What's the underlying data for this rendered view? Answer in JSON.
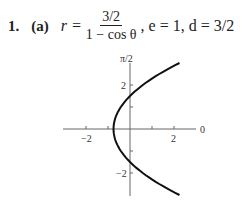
{
  "problem": {
    "number": "1.",
    "part": "(a)",
    "lhs": "r =",
    "fraction_numerator": "3/2",
    "fraction_denominator": "1 − cos θ",
    "rest": ", e = 1, d = 3/2"
  },
  "chart_data": {
    "type": "line",
    "axis_labels": {
      "polar_axis": "0",
      "vertical_axis": "π/2"
    },
    "x_ticks": [
      -2,
      -1,
      1,
      2
    ],
    "x_tick_labels": [
      "−2",
      "2"
    ],
    "y_ticks": [
      -2,
      -1,
      1,
      2
    ],
    "y_tick_labels": [
      "2",
      "−2"
    ],
    "xlim": [
      -3,
      3
    ],
    "ylim": [
      -3,
      3
    ],
    "series": [
      {
        "name": "parabola",
        "equation": "x = (y^2 - 2.25)/3",
        "points": [
          [
            2.35,
            -3
          ],
          [
            1.33,
            -2.5
          ],
          [
            0.58,
            -2
          ],
          [
            0,
            -1.5
          ],
          [
            -0.42,
            -1
          ],
          [
            -0.67,
            -0.5
          ],
          [
            -0.75,
            0
          ],
          [
            -0.67,
            0.5
          ],
          [
            -0.42,
            1
          ],
          [
            0,
            1.5
          ],
          [
            0.58,
            2
          ],
          [
            1.33,
            2.5
          ],
          [
            2.35,
            3
          ]
        ]
      }
    ]
  }
}
